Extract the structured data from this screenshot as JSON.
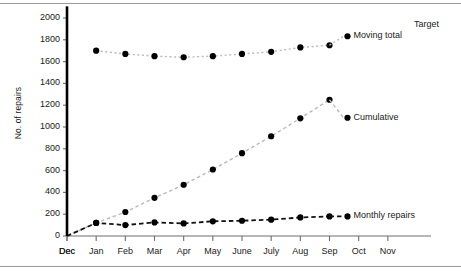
{
  "chart_data": {
    "type": "line",
    "title": "",
    "xlabel": "",
    "ylabel": "No. of repairs",
    "categories": [
      "Dec",
      "Jan",
      "Feb",
      "Mar",
      "Apr",
      "May",
      "June",
      "July",
      "Aug",
      "Sep",
      "Oct",
      "Nov",
      "Dec"
    ],
    "xtick_labels": [
      "Dec",
      "Jan",
      "Feb",
      "Mar",
      "Apr",
      "May",
      "June",
      "July",
      "Aug",
      "Sep",
      "Oct",
      "Nov",
      "Dec"
    ],
    "ytick_labels": [
      "0",
      "200",
      "400",
      "600",
      "800",
      "1000",
      "1200",
      "1400",
      "1600",
      "1800",
      "2000"
    ],
    "ytick_values": [
      0,
      200,
      400,
      600,
      800,
      1000,
      1200,
      1400,
      1600,
      1800,
      2000
    ],
    "ylim": [
      0,
      2000
    ],
    "grid": false,
    "legend_position": "inline-annotations",
    "series": [
      {
        "name": "Moving total",
        "label": "Moving total",
        "style": "dotted-light-gray",
        "marker": "filled-circle",
        "color": "#000000",
        "line_color": "#b4b4b4",
        "x": [
          "Jan",
          "Feb",
          "Mar",
          "Apr",
          "May",
          "June",
          "July",
          "Aug",
          "Sep"
        ],
        "values": [
          1700,
          1670,
          1650,
          1640,
          1650,
          1670,
          1690,
          1730,
          1750
        ]
      },
      {
        "name": "Cumulative",
        "label": "Cumulative",
        "style": "dashed-light-gray",
        "marker": "filled-circle",
        "color": "#000000",
        "line_color": "#b4b4b4",
        "x": [
          "Jan",
          "Feb",
          "Mar",
          "Apr",
          "May",
          "June",
          "July",
          "Aug",
          "Sep"
        ],
        "values": [
          120,
          220,
          350,
          470,
          610,
          760,
          915,
          1080,
          1250
        ]
      },
      {
        "name": "Monthly repairs",
        "label": "Monthly repairs",
        "style": "dashed-black",
        "marker": "filled-circle",
        "color": "#000000",
        "line_color": "#000000",
        "x": [
          "Jan",
          "Feb",
          "Mar",
          "Apr",
          "May",
          "June",
          "July",
          "Aug",
          "Sep"
        ],
        "values": [
          120,
          100,
          125,
          115,
          135,
          140,
          150,
          170,
          180
        ]
      },
      {
        "name": "Target",
        "label": "Target",
        "style": "solid-black-thick",
        "marker": "none",
        "color": "#000000",
        "line_color": "#000000",
        "x": [
          "Dec",
          "Dec"
        ],
        "values": [
          0,
          1960
        ]
      }
    ],
    "annotations": [
      {
        "text": "Moving total",
        "anchor": "Sep",
        "value": 1750
      },
      {
        "text": "Cumulative",
        "anchor": "Sep",
        "value": 1250
      },
      {
        "text": "Monthly repairs",
        "anchor": "Sep",
        "value": 180
      },
      {
        "text": "Target",
        "anchor": "Dec",
        "value": 1960
      }
    ]
  }
}
